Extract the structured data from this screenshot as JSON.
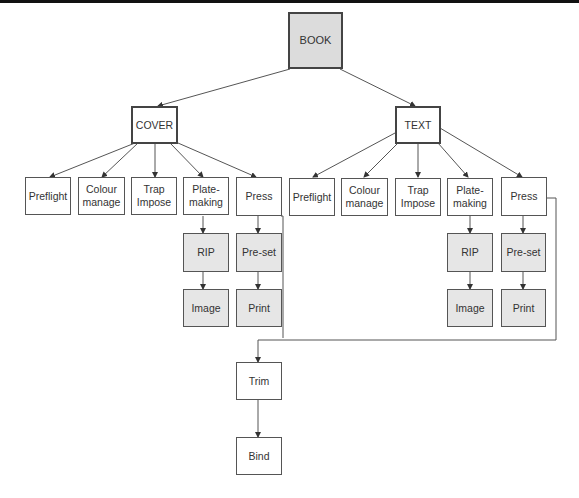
{
  "diagram": {
    "root": {
      "id": "book",
      "label": "BOOK"
    },
    "branches": [
      {
        "id": "cover",
        "label": "COVER",
        "children": [
          {
            "id": "cover-preflight",
            "label": "Preflight"
          },
          {
            "id": "cover-colour",
            "label": "Colour\nmanage"
          },
          {
            "id": "cover-trap",
            "label": "Trap\nImpose"
          },
          {
            "id": "cover-plate",
            "label": "Plate-\nmaking",
            "chain": [
              {
                "id": "cover-rip",
                "label": "RIP"
              },
              {
                "id": "cover-image",
                "label": "Image"
              }
            ]
          },
          {
            "id": "cover-press",
            "label": "Press",
            "chain": [
              {
                "id": "cover-preset",
                "label": "Pre-set"
              },
              {
                "id": "cover-print",
                "label": "Print"
              }
            ]
          }
        ]
      },
      {
        "id": "text",
        "label": "TEXT",
        "children": [
          {
            "id": "text-preflight",
            "label": "Preflight"
          },
          {
            "id": "text-colour",
            "label": "Colour\nmanage"
          },
          {
            "id": "text-trap",
            "label": "Trap\nImpose"
          },
          {
            "id": "text-plate",
            "label": "Plate-\nmaking",
            "chain": [
              {
                "id": "text-rip",
                "label": "RIP"
              },
              {
                "id": "text-image",
                "label": "Image"
              }
            ]
          },
          {
            "id": "text-press",
            "label": "Press",
            "chain": [
              {
                "id": "text-preset",
                "label": "Pre-set"
              },
              {
                "id": "text-print",
                "label": "Print"
              }
            ]
          }
        ]
      }
    ],
    "finishing": [
      {
        "id": "trim",
        "label": "Trim"
      },
      {
        "id": "bind",
        "label": "Bind"
      }
    ],
    "colors": {
      "shaded_fill": "#e6e6e6",
      "root_fill": "#dcdcdc",
      "line": "#555555"
    }
  }
}
